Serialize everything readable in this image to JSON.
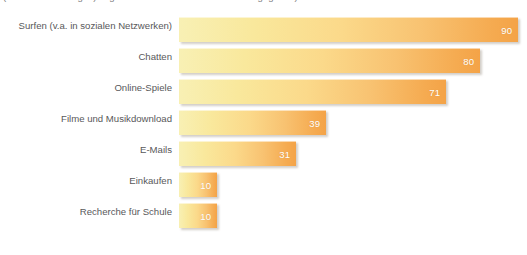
{
  "caption": {
    "text": "(Mehrfachnennungen) Jugendliche haben dies in Prozent angegeben)"
  },
  "chart_data": {
    "type": "bar",
    "orientation": "horizontal",
    "title": "",
    "subtitle": "",
    "xlabel": "",
    "ylabel": "",
    "xlim": [
      0,
      92
    ],
    "grid": false,
    "legend": false,
    "value_suffix": "",
    "categories": [
      "Surfen (v.a. in sozialen Netzwerken)",
      "Chatten",
      "Online-Spiele",
      "Filme und Musikdownload",
      "E-Mails",
      "Einkaufen",
      "Recherche für Schule"
    ],
    "values": [
      90,
      80,
      71,
      39,
      31,
      10,
      10
    ],
    "bars": [
      {
        "label": "Surfen (v.a. in sozialen Netzwerken)",
        "value": 90,
        "value_text": "90"
      },
      {
        "label": "Chatten",
        "value": 80,
        "value_text": "80"
      },
      {
        "label": "Online-Spiele",
        "value": 71,
        "value_text": "71"
      },
      {
        "label": "Filme und Musikdownload",
        "value": 39,
        "value_text": "39"
      },
      {
        "label": "E-Mails",
        "value": 31,
        "value_text": "31"
      },
      {
        "label": "Einkaufen",
        "value": 10,
        "value_text": "10"
      },
      {
        "label": "Recherche für Schule",
        "value": 10,
        "value_text": "10"
      }
    ],
    "colors": {
      "bar_gradient_start": "#F8F0B4",
      "bar_gradient_end": "#F4A347",
      "value_label": "#FFFFFF",
      "category_label": "#58585A",
      "background": "#FFFFFF"
    }
  }
}
